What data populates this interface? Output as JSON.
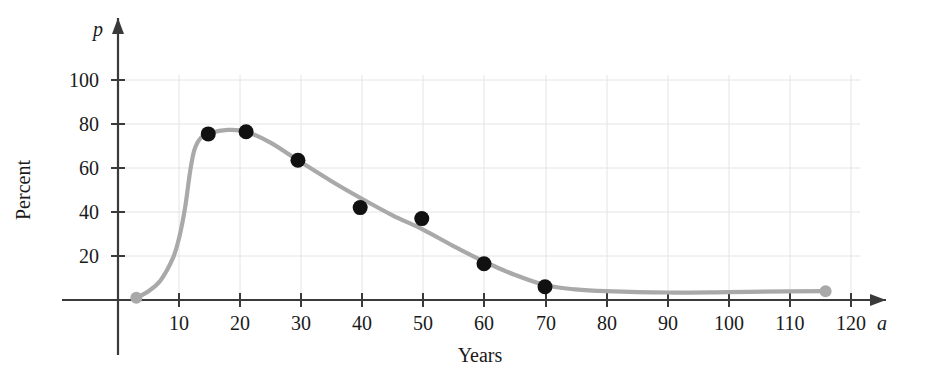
{
  "figure": {
    "background": "#ffffff",
    "curve_color": "#a9a9a9",
    "point_color": "#111111",
    "endpoint_color": "#a9a9a9",
    "grid_color": "#e2e2e2",
    "axis_color": "#3a3a3a"
  },
  "chart_data": {
    "type": "scatter",
    "title": "",
    "subtitle": "",
    "xlabel": "Years",
    "ylabel": "Percent",
    "x_axis_symbol": "a",
    "y_axis_symbol": "p",
    "xlim": [
      0,
      126
    ],
    "ylim": [
      0,
      112
    ],
    "grid": true,
    "legend": null,
    "xticks": [
      10,
      20,
      30,
      40,
      50,
      60,
      70,
      80,
      90,
      100,
      110,
      120
    ],
    "xtick_labels": [
      "10",
      "20",
      "30",
      "40",
      "50",
      "60",
      "70",
      "80",
      "90",
      "100",
      "110",
      "120"
    ],
    "yticks": [
      20,
      40,
      60,
      80,
      100
    ],
    "ytick_labels": [
      "20",
      "40",
      "60",
      "80",
      "100"
    ],
    "series": [
      {
        "name": "data points",
        "marker": "filled-circle",
        "color": "#111111",
        "points": [
          {
            "x": 14.8,
            "y": 75.5
          },
          {
            "x": 21.0,
            "y": 76.5
          },
          {
            "x": 29.5,
            "y": 63.5
          },
          {
            "x": 39.7,
            "y": 42.0
          },
          {
            "x": 49.8,
            "y": 37.0
          },
          {
            "x": 60.0,
            "y": 16.5
          },
          {
            "x": 70.0,
            "y": 6.0
          }
        ]
      },
      {
        "name": "fitted curve endpoints",
        "marker": "filled-circle",
        "color": "#a9a9a9",
        "points": [
          {
            "x": 3.0,
            "y": 1.0
          },
          {
            "x": 116.0,
            "y": 4.0
          }
        ]
      },
      {
        "name": "fitted curve",
        "marker": "line",
        "color": "#a9a9a9",
        "points": [
          {
            "x": 3.0,
            "y": 1.0
          },
          {
            "x": 5.0,
            "y": 4.0
          },
          {
            "x": 7.0,
            "y": 9.0
          },
          {
            "x": 9.0,
            "y": 19.0
          },
          {
            "x": 10.0,
            "y": 28.0
          },
          {
            "x": 11.0,
            "y": 42.0
          },
          {
            "x": 11.8,
            "y": 58.0
          },
          {
            "x": 12.5,
            "y": 68.0
          },
          {
            "x": 13.5,
            "y": 73.5
          },
          {
            "x": 15.0,
            "y": 75.8
          },
          {
            "x": 18.0,
            "y": 77.3
          },
          {
            "x": 21.0,
            "y": 76.5
          },
          {
            "x": 25.0,
            "y": 71.5
          },
          {
            "x": 29.5,
            "y": 63.5
          },
          {
            "x": 35.0,
            "y": 54.0
          },
          {
            "x": 40.0,
            "y": 46.0
          },
          {
            "x": 45.0,
            "y": 38.5
          },
          {
            "x": 50.0,
            "y": 32.0
          },
          {
            "x": 55.0,
            "y": 24.5
          },
          {
            "x": 60.0,
            "y": 17.5
          },
          {
            "x": 65.0,
            "y": 11.5
          },
          {
            "x": 70.0,
            "y": 6.8
          },
          {
            "x": 75.0,
            "y": 4.8
          },
          {
            "x": 80.0,
            "y": 4.0
          },
          {
            "x": 90.0,
            "y": 3.4
          },
          {
            "x": 100.0,
            "y": 3.6
          },
          {
            "x": 110.0,
            "y": 3.9
          },
          {
            "x": 116.0,
            "y": 4.0
          }
        ]
      }
    ]
  },
  "caption": {
    "cut_off_line": ""
  }
}
